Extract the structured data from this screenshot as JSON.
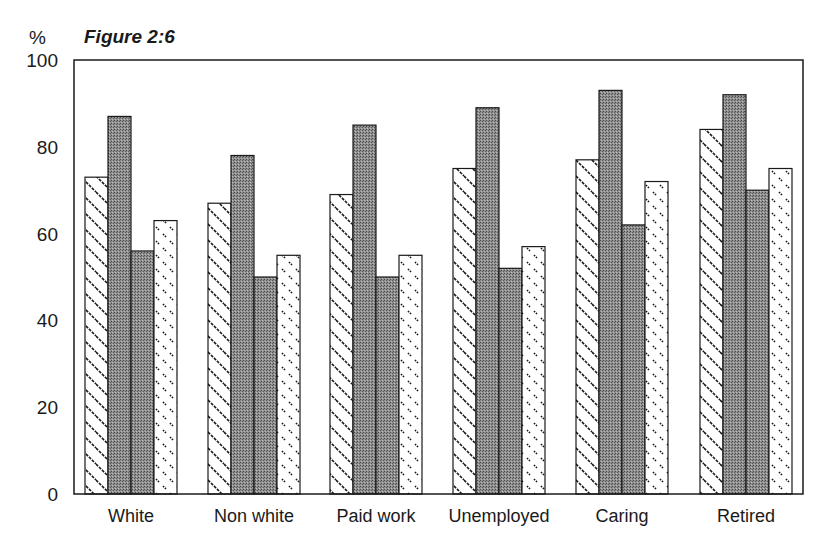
{
  "chart_data": {
    "type": "bar",
    "title": "Figure 2:6",
    "xlabel": "",
    "ylabel": "%",
    "ylim": [
      0,
      100
    ],
    "yticks": [
      0,
      20,
      40,
      60,
      80,
      100
    ],
    "grid": false,
    "legend": null,
    "categories": [
      "White",
      "Non white",
      "Paid work",
      "Unemployed",
      "Caring",
      "Retired"
    ],
    "series": [
      {
        "name": "Series 1 (diagonal hatch)",
        "pattern": "diagonal-hatch",
        "values": [
          73,
          67,
          69,
          75,
          77,
          84
        ]
      },
      {
        "name": "Series 2 (dark stipple)",
        "pattern": "dark-stipple",
        "values": [
          87,
          78,
          85,
          89,
          93,
          92
        ]
      },
      {
        "name": "Series 3 (dark stipple)",
        "pattern": "dark-stipple",
        "values": [
          56,
          50,
          50,
          52,
          62,
          70
        ]
      },
      {
        "name": "Series 4 (dotted dash)",
        "pattern": "dotted-dash",
        "values": [
          63,
          55,
          55,
          57,
          72,
          75
        ]
      }
    ]
  },
  "labels": {
    "title": "Figure 2:6",
    "unit": "%"
  },
  "colors": {
    "ink": "#1a1a1a",
    "stipple": "#8a8a8a",
    "background": "#ffffff"
  }
}
